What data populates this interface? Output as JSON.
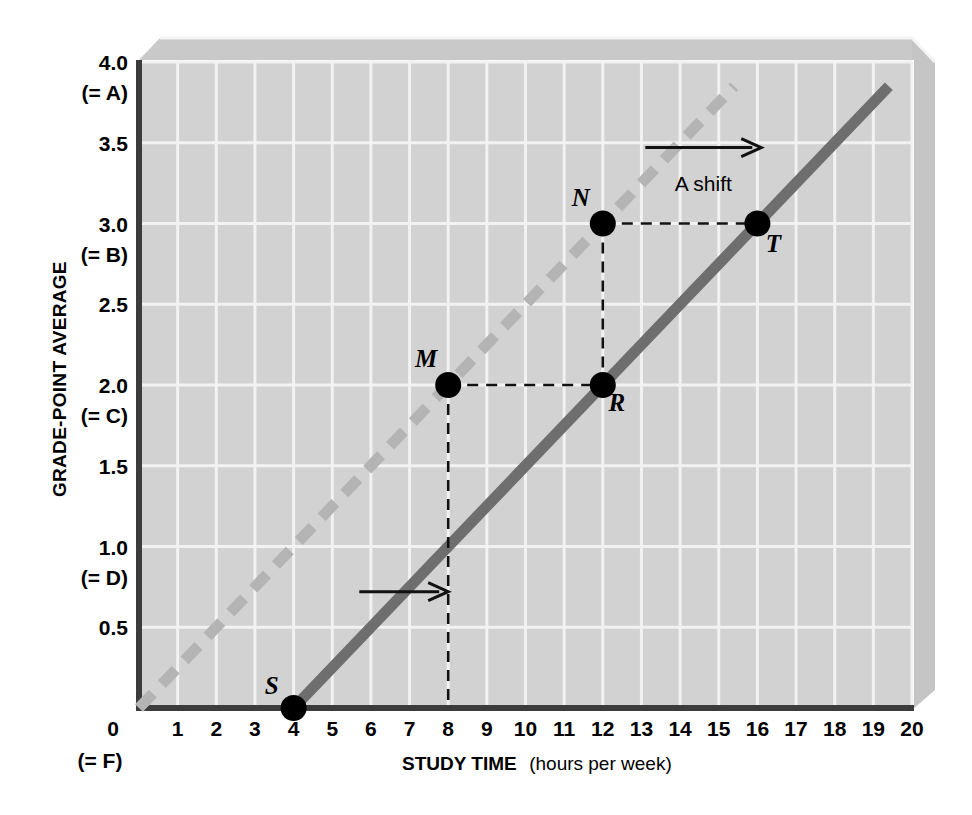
{
  "chart_data": {
    "type": "line",
    "title": "",
    "xlabel": "STUDY TIME",
    "xlabel_sub": "(hours per week)",
    "ylabel": "GRADE-POINT AVERAGE",
    "xlim": [
      0,
      20
    ],
    "ylim": [
      0,
      4.0
    ],
    "grid": true,
    "legend_position": "none",
    "x_ticks": [
      "0",
      "1",
      "2",
      "3",
      "4",
      "5",
      "6",
      "7",
      "8",
      "9",
      "10",
      "11",
      "12",
      "13",
      "14",
      "15",
      "16",
      "17",
      "18",
      "19",
      "20"
    ],
    "x_origin_sublabel": "(= F)",
    "y_ticks": [
      {
        "value": 0.5,
        "label": "0.5",
        "sub": ""
      },
      {
        "value": 1.0,
        "label": "1.0",
        "sub": "(= D)"
      },
      {
        "value": 1.5,
        "label": "1.5",
        "sub": ""
      },
      {
        "value": 2.0,
        "label": "2.0",
        "sub": "(= C)"
      },
      {
        "value": 2.5,
        "label": "2.5",
        "sub": ""
      },
      {
        "value": 3.0,
        "label": "3.0",
        "sub": "(= B)"
      },
      {
        "value": 3.5,
        "label": "3.5",
        "sub": ""
      },
      {
        "value": 4.0,
        "label": "4.0",
        "sub": "(= A)"
      }
    ],
    "series": [
      {
        "name": "original-relationship",
        "style": "dashed",
        "color": "#b4b4b4",
        "x": [
          0,
          15.4
        ],
        "y": [
          0,
          3.85
        ],
        "slope": 0.25,
        "intercept": 0
      },
      {
        "name": "shifted-relationship",
        "style": "solid",
        "color": "#6e6e6e",
        "x": [
          4,
          19.4
        ],
        "y": [
          0,
          3.85
        ],
        "slope": 0.25,
        "intercept": -1.0
      }
    ],
    "points": [
      {
        "label": "S",
        "x": 4,
        "y": 0.0,
        "label_dx": -22,
        "label_dy": -14
      },
      {
        "label": "M",
        "x": 8,
        "y": 2.0,
        "label_dx": -22,
        "label_dy": -18
      },
      {
        "label": "R",
        "x": 12,
        "y": 2.0,
        "label_dx": 14,
        "label_dy": 26
      },
      {
        "label": "N",
        "x": 12,
        "y": 3.0,
        "label_dx": -22,
        "label_dy": -18
      },
      {
        "label": "T",
        "x": 16,
        "y": 3.0,
        "label_dx": 16,
        "label_dy": 28
      }
    ],
    "connectors": [
      {
        "name": "m-to-r",
        "x1": 8,
        "y1": 2.0,
        "x2": 12,
        "y2": 2.0
      },
      {
        "name": "n-to-t",
        "x1": 12,
        "y1": 3.0,
        "x2": 16,
        "y2": 3.0
      },
      {
        "name": "m-drop",
        "x1": 8,
        "y1": 2.0,
        "x2": 8,
        "y2": 0.0
      },
      {
        "name": "n-drop",
        "x1": 12,
        "y1": 3.0,
        "x2": 12,
        "y2": 2.0
      }
    ],
    "annotations": [
      {
        "name": "shift-arrow-lower",
        "text": "",
        "arrow_x1": 5.7,
        "arrow_y": 0.72,
        "arrow_x2": 8.0
      },
      {
        "name": "shift-arrow-upper",
        "text": "A shift",
        "arrow_x1": 13.1,
        "arrow_y": 3.47,
        "arrow_x2": 16.1,
        "text_x": 14.6,
        "text_y": 3.25
      }
    ],
    "colors": {
      "plot_background": "#d2d2d2",
      "gridline": "#f2f2f2",
      "axis_line": "#3c3c3c",
      "panel_top": "#c8c8c8",
      "panel_right": "#c4c4c4",
      "point_fill": "#000000",
      "dashed_series": "#b4b4b4",
      "solid_series": "#6e6e6e"
    }
  }
}
